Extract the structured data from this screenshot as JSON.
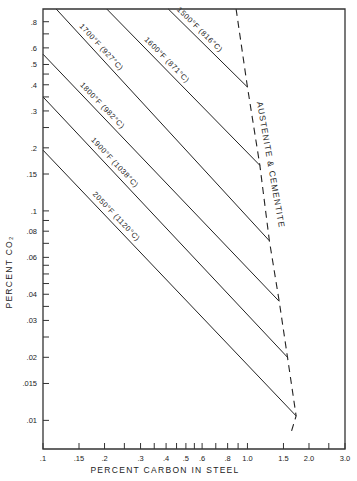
{
  "chart_data": {
    "type": "line",
    "title": "",
    "xlabel": "PERCENT CARBON IN STEEL",
    "ylabel": "PERCENT CO2",
    "xscale": "log",
    "yscale": "log",
    "xlim": [
      0.1,
      3.0
    ],
    "ylim": [
      0.0073,
      0.92
    ],
    "grid": false,
    "legend": "none (lines labeled inline)",
    "x_ticks": [
      {
        "v": 0.1,
        "label": ".1"
      },
      {
        "v": 0.15,
        "label": ".15"
      },
      {
        "v": 0.2,
        "label": ".2"
      },
      {
        "v": 0.25,
        "label": ""
      },
      {
        "v": 0.3,
        "label": ".3"
      },
      {
        "v": 0.35,
        "label": ""
      },
      {
        "v": 0.4,
        "label": ".4"
      },
      {
        "v": 0.45,
        "label": ""
      },
      {
        "v": 0.5,
        "label": ".5"
      },
      {
        "v": 0.55,
        "label": ""
      },
      {
        "v": 0.6,
        "label": ".6"
      },
      {
        "v": 0.7,
        "label": ""
      },
      {
        "v": 0.8,
        "label": ".8"
      },
      {
        "v": 0.9,
        "label": ""
      },
      {
        "v": 1.0,
        "label": "1.0"
      },
      {
        "v": 1.5,
        "label": "1.5"
      },
      {
        "v": 2.0,
        "label": "2.0"
      },
      {
        "v": 2.5,
        "label": ""
      },
      {
        "v": 3.0,
        "label": "3.0"
      }
    ],
    "y_ticks": [
      {
        "v": 0.8,
        "label": ".8"
      },
      {
        "v": 0.7,
        "label": ""
      },
      {
        "v": 0.6,
        "label": ".6"
      },
      {
        "v": 0.5,
        "label": ".5"
      },
      {
        "v": 0.45,
        "label": ""
      },
      {
        "v": 0.4,
        "label": ".4"
      },
      {
        "v": 0.35,
        "label": ""
      },
      {
        "v": 0.3,
        "label": ".3"
      },
      {
        "v": 0.25,
        "label": ""
      },
      {
        "v": 0.2,
        "label": ".2"
      },
      {
        "v": 0.15,
        "label": ".15"
      },
      {
        "v": 0.1,
        "label": ".1"
      },
      {
        "v": 0.09,
        "label": ""
      },
      {
        "v": 0.08,
        "label": ".08"
      },
      {
        "v": 0.07,
        "label": ""
      },
      {
        "v": 0.06,
        "label": ".06"
      },
      {
        "v": 0.055,
        "label": ""
      },
      {
        "v": 0.05,
        "label": ""
      },
      {
        "v": 0.045,
        "label": ""
      },
      {
        "v": 0.04,
        "label": ".04"
      },
      {
        "v": 0.035,
        "label": ""
      },
      {
        "v": 0.03,
        "label": ".03"
      },
      {
        "v": 0.025,
        "label": ""
      },
      {
        "v": 0.02,
        "label": ".02"
      },
      {
        "v": 0.015,
        "label": ".015"
      },
      {
        "v": 0.01,
        "label": ".01"
      }
    ],
    "series": [
      {
        "name": "1500°F (816°C)",
        "label_f": "1500°F",
        "label_c": "(816°C)",
        "x": [
          0.41,
          1.0
        ],
        "y": [
          0.92,
          0.39
        ]
      },
      {
        "name": "1600°F (871°C)",
        "label_f": "1600°F",
        "label_c": "(871°C)",
        "x": [
          0.205,
          1.15
        ],
        "y": [
          0.92,
          0.165
        ]
      },
      {
        "name": "1700°F (927°C)",
        "label_f": "1700°F",
        "label_c": "(927°C)",
        "x": [
          0.116,
          1.28
        ],
        "y": [
          0.92,
          0.072
        ]
      },
      {
        "name": "1800°F (982°C)",
        "label_f": "1800°F",
        "label_c": "(982°C)",
        "x": [
          0.1,
          1.43
        ],
        "y": [
          0.56,
          0.037
        ]
      },
      {
        "name": "1900°F (1038°C)",
        "label_f": "1900°F",
        "label_c": "(1038°C)",
        "x": [
          0.1,
          1.57
        ],
        "y": [
          0.35,
          0.02
        ]
      },
      {
        "name": "2050°F (1120°C)",
        "label_f": "2050°F",
        "label_c": "(1120°C)",
        "x": [
          0.1,
          1.73
        ],
        "y": [
          0.195,
          0.0105
        ]
      }
    ],
    "boundary": {
      "name": "AUSTENITE & CEMENTITE",
      "style": "dashed",
      "x": [
        0.88,
        1.0,
        1.15,
        1.28,
        1.43,
        1.57,
        1.73,
        1.62
      ],
      "y": [
        0.92,
        0.39,
        0.165,
        0.072,
        0.037,
        0.02,
        0.0105,
        0.0085
      ]
    },
    "annotations": [
      {
        "text": "AUSTENITE",
        "rotation": 80
      },
      {
        "text": "&",
        "rotation": 80
      },
      {
        "text": "CEMENTITE",
        "rotation": 80
      }
    ]
  }
}
